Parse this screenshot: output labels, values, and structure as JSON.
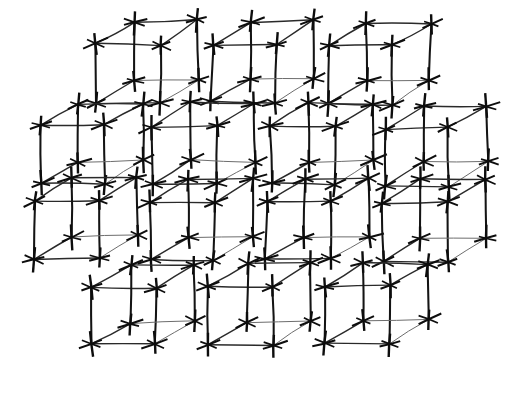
{
  "figure": {
    "background_color": "#ffffff",
    "stroke_color": "#141414",
    "faint_stroke_color": "#6d6d6d",
    "atom_color": "#0d0d0d",
    "width": 527,
    "height": 395,
    "unit_cell_count": 14,
    "atom_marker_count": 112,
    "row_counts": [
      3,
      4,
      4,
      3
    ]
  },
  "chart_data": {
    "type": "scatter",
    "subtitle": "",
    "xlabel": "",
    "ylabel": "",
    "grid": false,
    "legend": null,
    "projection": {
      "name": "oblique",
      "x_axis": [
        1,
        0
      ],
      "y_axis": [
        0.52,
        -0.3
      ],
      "z_axis": [
        0,
        -1
      ]
    },
    "cell_geometry": {
      "edge_a": 64,
      "edge_b_dx": 38,
      "edge_b_dy": -23,
      "edge_c": 58,
      "vertices_per_cell": 8,
      "edges_per_cell": 12
    },
    "atom_marker": {
      "name": "three-axis-star",
      "arms": 3,
      "arm_angles_deg": [
        90,
        20,
        160
      ],
      "arm_half_lengths": [
        11,
        12,
        9
      ]
    },
    "cells": [
      {
        "id": "cell-r1-c1",
        "row": 1,
        "col": 1,
        "x": 96,
        "y": 102
      },
      {
        "id": "cell-r1-c2",
        "row": 1,
        "col": 2,
        "x": 212,
        "y": 102
      },
      {
        "id": "cell-r1-c3",
        "row": 1,
        "col": 3,
        "x": 328,
        "y": 104
      },
      {
        "id": "cell-r2-c1",
        "row": 2,
        "col": 1,
        "x": 40,
        "y": 184
      },
      {
        "id": "cell-r2-c2",
        "row": 2,
        "col": 2,
        "x": 153,
        "y": 184
      },
      {
        "id": "cell-r2-c3",
        "row": 2,
        "col": 3,
        "x": 271,
        "y": 184
      },
      {
        "id": "cell-r2-c4",
        "row": 2,
        "col": 4,
        "x": 385,
        "y": 186
      },
      {
        "id": "cell-r3-c1",
        "row": 3,
        "col": 1,
        "x": 35,
        "y": 259
      },
      {
        "id": "cell-r3-c2",
        "row": 3,
        "col": 2,
        "x": 150,
        "y": 260
      },
      {
        "id": "cell-r3-c3",
        "row": 3,
        "col": 3,
        "x": 266,
        "y": 259
      },
      {
        "id": "cell-r3-c4",
        "row": 3,
        "col": 4,
        "x": 383,
        "y": 261
      },
      {
        "id": "cell-r4-c1",
        "row": 4,
        "col": 1,
        "x": 92,
        "y": 345
      },
      {
        "id": "cell-r4-c2",
        "row": 4,
        "col": 2,
        "x": 209,
        "y": 345
      },
      {
        "id": "cell-r4-c3",
        "row": 4,
        "col": 3,
        "x": 326,
        "y": 344
      }
    ]
  }
}
